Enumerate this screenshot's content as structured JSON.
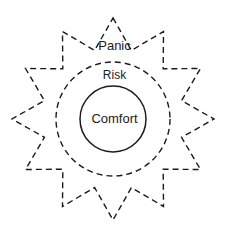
{
  "diagram": {
    "background_color": "#ffffff",
    "stroke_color": "#1b1b1b",
    "center": {
      "x": 113,
      "y": 119
    },
    "zones": [
      {
        "id": "panic",
        "label": "Panic",
        "shape": "starburst",
        "points": 12,
        "outer_radius": 101,
        "inner_radius": 71,
        "stroke": "dashed",
        "stroke_color": "#1b1b1b",
        "stroke_width": 1.4,
        "fill": "none",
        "label_position": {
          "x": 113,
          "y": 46
        }
      },
      {
        "id": "risk",
        "label": "Risk",
        "shape": "circle",
        "radius": 57,
        "stroke": "dashed",
        "stroke_color": "#1b1b1b",
        "stroke_width": 1.4,
        "fill": "none",
        "label_position": {
          "x": 113,
          "y": 75
        }
      },
      {
        "id": "comfort",
        "label": "Comfort",
        "shape": "circle",
        "radius": 33,
        "stroke": "solid",
        "stroke_color": "#1b1b1b",
        "stroke_width": 1.5,
        "fill": "none",
        "label_position": {
          "x": 113,
          "y": 119
        }
      }
    ]
  }
}
